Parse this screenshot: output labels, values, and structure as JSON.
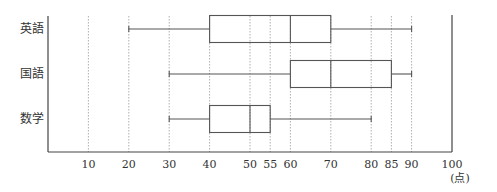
{
  "chart_data": {
    "type": "boxplot",
    "title": "",
    "xlabel": "",
    "unit_label": "(点)",
    "xlim": [
      0,
      100
    ],
    "xticks": [
      10,
      20,
      30,
      40,
      50,
      55,
      60,
      70,
      80,
      85,
      90,
      100
    ],
    "grid": "vertical dotted",
    "categories": [
      "英語",
      "国語",
      "数学"
    ],
    "series": [
      {
        "name": "英語",
        "min": 20,
        "q1": 40,
        "median": 60,
        "q3": 70,
        "max": 90
      },
      {
        "name": "国語",
        "min": 30,
        "q1": 60,
        "median": 70,
        "q3": 85,
        "max": 90
      },
      {
        "name": "数学",
        "min": 30,
        "q1": 40,
        "median": 50,
        "q3": 55,
        "max": 80
      }
    ]
  }
}
